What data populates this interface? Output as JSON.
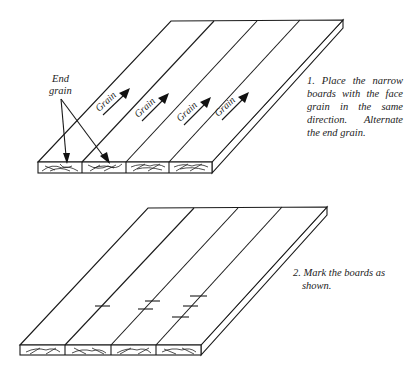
{
  "figure1": {
    "end_grain_label_line1": "End",
    "end_grain_label_line2": "grain",
    "grain_labels": [
      "Grain",
      "Grain",
      "Grain",
      "Grain"
    ],
    "caption": "1. Place the narrow boards with the face grain in the same direction. Alternate the end grain.",
    "board_count": 4
  },
  "figure2": {
    "caption_line1": "2. Mark the boards as",
    "caption_line2": "shown.",
    "board_count": 4,
    "marks_per_joint": [
      1,
      2,
      3
    ]
  },
  "colors": {
    "ink": "#1a1a1a",
    "paper": "#ffffff"
  }
}
